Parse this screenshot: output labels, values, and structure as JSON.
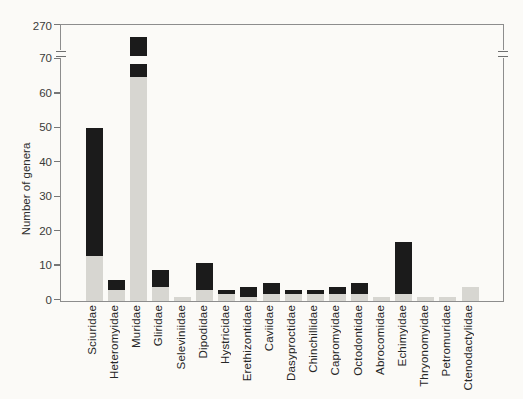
{
  "chart_data": {
    "type": "bar",
    "stacked": true,
    "title": "",
    "xlabel": "",
    "ylabel": "Number of genera",
    "grid": false,
    "legend": "none",
    "y_axis": {
      "lower_segment_ticks": [
        0,
        10,
        20,
        30,
        40,
        50,
        60,
        70
      ],
      "axis_break": true,
      "upper_tick_label": "270",
      "note": "y-axis broken between 70 and 270; Muridae bar crosses the break"
    },
    "categories": [
      "Sciuridae",
      "Heteromyidae",
      "Muridae",
      "Gliridae",
      "Seleviniidae",
      "Dipodidae",
      "Hystricidae",
      "Erethizontidae",
      "Caviidae",
      "Dasyproctidae",
      "Chinchillidae",
      "Capromyidae",
      "Octodontidae",
      "Abrocomidae",
      "Echimyidae",
      "Thryonomyidae",
      "Petromuridae",
      "Ctenodactylidae"
    ],
    "series": [
      {
        "name": "lower-grey-segment",
        "color": "#d7d6d1",
        "values": [
          13,
          3,
          65,
          4,
          1,
          3,
          2,
          1,
          2,
          2,
          2,
          2,
          2,
          1,
          2,
          1,
          1,
          4
        ]
      },
      {
        "name": "upper-black-segment",
        "color": "#1b1b1b",
        "values": [
          37,
          3,
          216,
          5,
          0,
          8,
          1,
          3,
          3,
          1,
          1,
          2,
          3,
          0,
          15,
          0,
          0,
          0
        ]
      }
    ],
    "totals": [
      50,
      6,
      281,
      9,
      1,
      11,
      3,
      4,
      5,
      3,
      3,
      4,
      5,
      1,
      17,
      1,
      1,
      4
    ],
    "break_bar_index": 2
  },
  "colors": {
    "background": "#fbfaf7",
    "frame": "#8d8d8d",
    "bar_grey": "#d7d6d1",
    "bar_black": "#1b1b1b",
    "text": "#2e2e2e"
  }
}
